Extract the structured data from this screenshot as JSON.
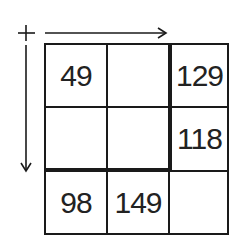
{
  "diagram": {
    "type": "number-grid-puzzle",
    "rows": 3,
    "cols": 3,
    "cells": [
      [
        "49",
        "",
        "129"
      ],
      [
        "",
        "",
        "118"
      ],
      [
        "98",
        "149",
        ""
      ]
    ],
    "markers": {
      "origin": "plus-sign",
      "row_arrow": "right",
      "column_arrow": "down"
    },
    "thick_borders": [
      {
        "orientation": "vertical",
        "between_cols": [
          2,
          3
        ],
        "rows": [
          1,
          2
        ]
      },
      {
        "orientation": "horizontal",
        "between_rows": [
          2,
          3
        ],
        "cols": [
          1,
          2
        ]
      }
    ],
    "colors": {
      "ink": "#1a1a1a",
      "background": "#ffffff"
    }
  }
}
